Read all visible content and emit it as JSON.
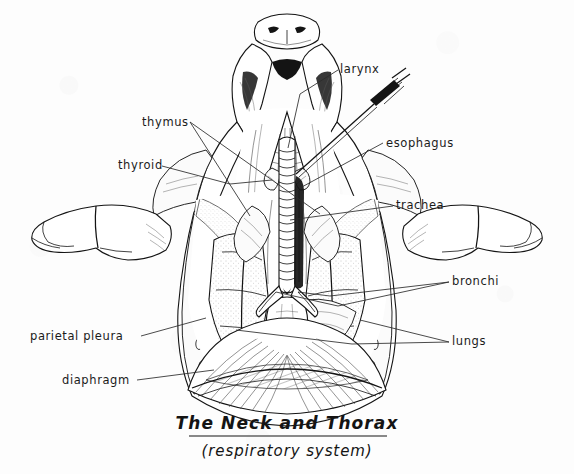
{
  "figure": {
    "title": "The Neck and Thorax",
    "subtitle": "(respiratory system)",
    "style": "black-and-white line-and-stipple scientific illustration on off-white paper",
    "background_color": "#fdfdfd",
    "ink_color": "#141414"
  },
  "labels": [
    {
      "id": "larynx",
      "text": "larynx",
      "x": 340,
      "y": 73,
      "anchor": "start"
    },
    {
      "id": "thymus",
      "text": "thymus",
      "x": 142,
      "y": 126,
      "anchor": "start"
    },
    {
      "id": "esophagus",
      "text": "esophagus",
      "x": 386,
      "y": 147,
      "anchor": "start"
    },
    {
      "id": "thyroid",
      "text": "thyroid",
      "x": 118,
      "y": 169,
      "anchor": "start"
    },
    {
      "id": "trachea",
      "text": "trachea",
      "x": 396,
      "y": 209,
      "anchor": "start"
    },
    {
      "id": "bronchi",
      "text": "bronchi",
      "x": 452,
      "y": 285,
      "anchor": "start"
    },
    {
      "id": "parietal-pleura",
      "text": "parietal  pleura",
      "x": 30,
      "y": 340,
      "anchor": "start"
    },
    {
      "id": "lungs",
      "text": "lungs",
      "x": 452,
      "y": 345,
      "anchor": "start"
    },
    {
      "id": "diaphragm",
      "text": "diaphragm",
      "x": 62,
      "y": 384,
      "anchor": "start"
    }
  ],
  "structures": [
    "snout with nostrils",
    "lower jaw and mouth opening",
    "larynx cone at throat apex",
    "thyroid gland",
    "thymus lobes",
    "trachea with cartilage rings",
    "esophagus",
    "left and right bronchi",
    "left and right lungs",
    "diaphragm dome",
    "parietal pleura lining chest wall",
    "cut rib cage walls",
    "left forelimb",
    "right forelimb",
    "dissection forceps probe"
  ],
  "instrument": {
    "name": "forceps-probe",
    "description": "dissection forceps inserted toward the larynx from upper right"
  }
}
